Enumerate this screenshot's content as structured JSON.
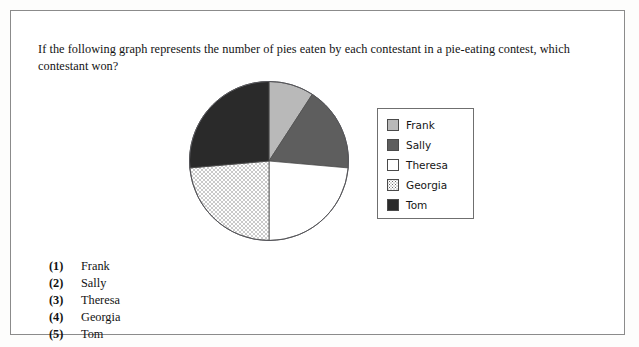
{
  "question": {
    "text": "If the following graph represents the number of pies eaten by each contestant in a pie-eating contest, which contestant won?"
  },
  "chart_data": {
    "type": "pie",
    "title": "",
    "xlabel": "",
    "ylabel": "",
    "legend_position": "right",
    "grid": false,
    "categories": [
      "Frank",
      "Sally",
      "Theresa",
      "Georgia",
      "Tom"
    ],
    "values": [
      33,
      62,
      85,
      85,
      95
    ],
    "value_unit": "degrees",
    "percentages": [
      9.2,
      17.2,
      23.6,
      23.6,
      26.4
    ],
    "start_angle_deg": 0,
    "direction": "clockwise",
    "slice_styles": [
      {
        "name": "Frank",
        "fill": "#b9b9b9",
        "pattern": "solid"
      },
      {
        "name": "Sally",
        "fill": "#5e5e5e",
        "pattern": "solid"
      },
      {
        "name": "Theresa",
        "fill": "#ffffff",
        "pattern": "solid"
      },
      {
        "name": "Georgia",
        "fill": "#ffffff",
        "pattern": "dotted"
      },
      {
        "name": "Tom",
        "fill": "#2a2a2a",
        "pattern": "solid"
      }
    ]
  },
  "legend": {
    "entries": [
      {
        "label": "Frank",
        "swatch": "light-gray"
      },
      {
        "label": "Sally",
        "swatch": "medium-gray"
      },
      {
        "label": "Theresa",
        "swatch": "white"
      },
      {
        "label": "Georgia",
        "swatch": "dotted"
      },
      {
        "label": "Tom",
        "swatch": "black"
      }
    ]
  },
  "choices": [
    {
      "number": "(1)",
      "label": "Frank"
    },
    {
      "number": "(2)",
      "label": "Sally"
    },
    {
      "number": "(3)",
      "label": "Theresa"
    },
    {
      "number": "(4)",
      "label": "Georgia"
    },
    {
      "number": "(5)",
      "label": "Tom"
    }
  ],
  "colors": {
    "frame_border": "#8b8b8b",
    "pie_outline": "#4a4a4a",
    "text": "#131313"
  }
}
